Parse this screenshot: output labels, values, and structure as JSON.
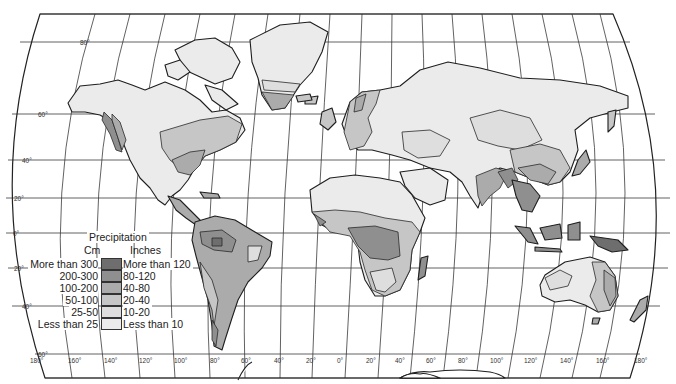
{
  "map": {
    "title": "Precipitation",
    "projection": "world graticule (Robinson-like)",
    "colors": {
      "more_than_300": "#6e6e6e",
      "200_300": "#8f8f8f",
      "100_200": "#ababab",
      "50_100": "#c6c6c6",
      "25_50": "#dedede",
      "less_than_25": "#ebebeb",
      "water": "#ffffff",
      "lines": "#222222"
    },
    "latitude_labels": [
      {
        "label": "80°"
      },
      {
        "label": "60°"
      },
      {
        "label": "40°"
      },
      {
        "label": "20°"
      },
      {
        "label": "0°"
      },
      {
        "label": "20°"
      },
      {
        "label": "40°"
      },
      {
        "label": "60°"
      }
    ],
    "longitude_labels": [
      "180°",
      "160°",
      "140°",
      "120°",
      "100°",
      "80°",
      "60°",
      "40°",
      "20°",
      "0°",
      "20°",
      "40°",
      "60°",
      "80°",
      "100°",
      "120°",
      "140°",
      "160°",
      "180°"
    ]
  },
  "legend": {
    "title": "Precipitation",
    "cm_header": "Cm",
    "inches_header": "Inches",
    "rows": [
      {
        "cm": "More than 300",
        "inches": "More than 120",
        "color": "#6e6e6e"
      },
      {
        "cm": "200-300",
        "inches": "80-120",
        "color": "#8f8f8f"
      },
      {
        "cm": "100-200",
        "inches": "40-80",
        "color": "#ababab"
      },
      {
        "cm": "50-100",
        "inches": "20-40",
        "color": "#c6c6c6"
      },
      {
        "cm": "25-50",
        "inches": "10-20",
        "color": "#dedede"
      },
      {
        "cm": "Less than 25",
        "inches": "Less than 10",
        "color": "#ebebeb"
      }
    ]
  }
}
